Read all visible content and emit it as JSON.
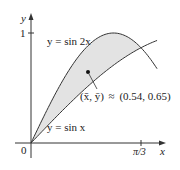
{
  "figure": {
    "type": "region-between-curves-with-centroid",
    "axes": {
      "x_label": "x",
      "y_label": "y",
      "origin_label": "0",
      "y_tick_label": "1",
      "x_tick_label": "π/3"
    },
    "curves": [
      {
        "label": "y = sin 2x",
        "expression": "sin(2x)"
      },
      {
        "label": "y = sin x",
        "expression": "sin(x)"
      }
    ],
    "centroid": {
      "label_lhs": "(x̄, ȳ)",
      "approx_symbol": "≈",
      "value": "(0.54, 0.65)",
      "x": 0.54,
      "y": 0.65
    },
    "colors": {
      "region_fill": "#e3e3e3",
      "curve_stroke": "#333333",
      "axis_stroke": "#333333"
    }
  },
  "chart_data": {
    "type": "line",
    "title": "",
    "xlabel": "x",
    "ylabel": "y",
    "xlim": [
      0,
      1.2
    ],
    "ylim": [
      0,
      1.1
    ],
    "x_ticks": [
      {
        "value": 1.0472,
        "label": "π/3"
      }
    ],
    "y_ticks": [
      {
        "value": 1,
        "label": "1"
      }
    ],
    "series": [
      {
        "name": "y = sin 2x",
        "function": "sin(2x)"
      },
      {
        "name": "y = sin x",
        "function": "sin(x)"
      }
    ],
    "shaded_region": {
      "between": [
        "y = sin 2x",
        "y = sin x"
      ],
      "x_from": 0,
      "x_to": 1.0472
    },
    "annotations": [
      {
        "text": "(x̄, ȳ) ≈ (0.54, 0.65)",
        "point": [
          0.54,
          0.65
        ]
      }
    ],
    "grid": false,
    "legend": "none"
  }
}
